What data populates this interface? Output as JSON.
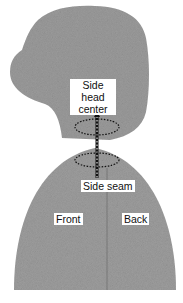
{
  "diagram": {
    "type": "mannequin-side-view",
    "fill_color": "#9a9a9a",
    "labels": {
      "head_center": "Side head\ncenter",
      "head_center_line1": "Side head",
      "head_center_line2": "center",
      "side_seam": "Side seam",
      "front": "Front",
      "back": "Back"
    }
  }
}
